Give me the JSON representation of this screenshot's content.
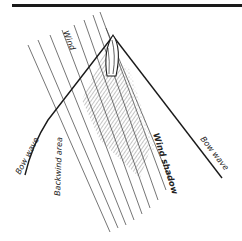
{
  "diagram": {
    "type": "sailing-wind-diagram",
    "labels": {
      "wind": "Wind",
      "bow_wave_left": "Bow wave",
      "backwind_area": "Backwind area",
      "wind_shadow": "Wind shadow",
      "bow_wave_right": "Bow wave"
    },
    "colors": {
      "ink": "#1a1a1a",
      "wind_lines": "#3a3a3a",
      "hatch": "#555555",
      "background": "#ffffff"
    }
  }
}
